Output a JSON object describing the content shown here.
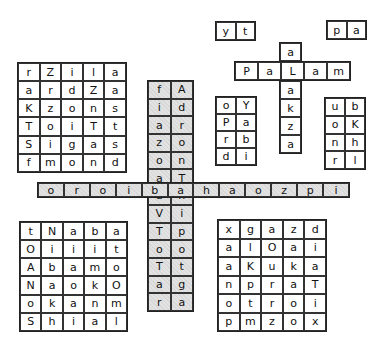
{
  "puzzle": {
    "top_left_grid": {
      "rows": [
        [
          "r",
          "Z",
          "i",
          "l",
          "a"
        ],
        [
          "a",
          "r",
          "d",
          "Z",
          "a"
        ],
        [
          "K",
          "z",
          "o",
          "n",
          "s"
        ],
        [
          "T",
          "o",
          "i",
          "T",
          "t"
        ],
        [
          "S",
          "i",
          "g",
          "a",
          "s"
        ],
        [
          "f",
          "m",
          "o",
          "n",
          "d"
        ]
      ]
    },
    "center_column": {
      "rows": [
        [
          "f",
          "A"
        ],
        [
          "i",
          "d"
        ],
        [
          "a",
          "r"
        ],
        [
          "z",
          "o"
        ],
        [
          "o",
          "n"
        ],
        [
          "a",
          "T"
        ],
        [
          "a",
          "h"
        ],
        [
          "V",
          "i"
        ],
        [
          "T",
          "p"
        ],
        [
          "o",
          "o"
        ],
        [
          "T",
          "t"
        ],
        [
          "a",
          "g"
        ],
        [
          "r",
          "a"
        ]
      ]
    },
    "horizontal_strip": {
      "cells": [
        "o",
        "r",
        "o",
        "i",
        "b",
        "a",
        "h",
        "a",
        "o",
        "z",
        "p",
        "i"
      ]
    },
    "small_box_yt": {
      "cells": [
        "y",
        "t"
      ]
    },
    "small_box_pa": {
      "cells": [
        "p",
        "a"
      ]
    },
    "palam_row": {
      "cells": [
        "P",
        "a",
        "L",
        "a",
        "m"
      ]
    },
    "palam_above": {
      "cells": [
        "a"
      ]
    },
    "palam_below": {
      "cells": [
        "a",
        "k",
        "z",
        "a"
      ]
    },
    "oy_grid": {
      "rows": [
        [
          "o",
          "Y"
        ],
        [
          "P",
          "a"
        ],
        [
          "r",
          "b"
        ],
        [
          "d",
          "i"
        ]
      ]
    },
    "ub_grid": {
      "rows": [
        [
          "u",
          "b"
        ],
        [
          "o",
          "K"
        ],
        [
          "n",
          "h"
        ],
        [
          "r",
          "l"
        ]
      ]
    },
    "bottom_left_grid": {
      "rows": [
        [
          "t",
          "N",
          "a",
          "b",
          "a"
        ],
        [
          "O",
          "i",
          "i",
          "i",
          "t"
        ],
        [
          "A",
          "b",
          "a",
          "m",
          "o"
        ],
        [
          "N",
          "a",
          "o",
          "k",
          "O"
        ],
        [
          "o",
          "k",
          "a",
          "n",
          "m"
        ],
        [
          "S",
          "h",
          "i",
          "a",
          "l"
        ]
      ]
    },
    "bottom_right_grid": {
      "rows": [
        [
          "x",
          "g",
          "a",
          "z",
          "d"
        ],
        [
          "a",
          "l",
          "O",
          "a",
          "i"
        ],
        [
          "a",
          "K",
          "u",
          "k",
          "a"
        ],
        [
          "n",
          "p",
          "r",
          "a",
          "T"
        ],
        [
          "o",
          "t",
          "r",
          "o",
          "i"
        ],
        [
          "p",
          "m",
          "z",
          "o",
          "x"
        ]
      ]
    }
  }
}
